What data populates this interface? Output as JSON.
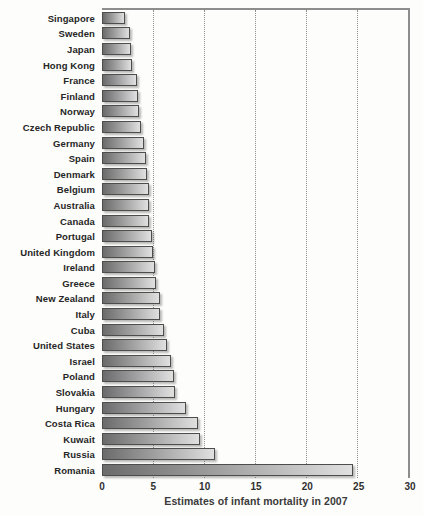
{
  "chart_data": {
    "type": "bar",
    "orientation": "horizontal",
    "title": "",
    "xlabel": "Estimates of infant mortality in 2007",
    "ylabel": "",
    "xlim": [
      0,
      30
    ],
    "x_ticks": [
      0,
      5,
      10,
      15,
      20,
      25,
      30
    ],
    "gridline_values": [
      5,
      10,
      15,
      20,
      25
    ],
    "grid": "vertical dotted gridlines; solid top and right plot border",
    "legend": "none",
    "categories": [
      "Singapore",
      "Sweden",
      "Japan",
      "Hong Kong",
      "France",
      "Finland",
      "Norway",
      "Czech Republic",
      "Germany",
      "Spain",
      "Denmark",
      "Belgium",
      "Australia",
      "Canada",
      "Portugal",
      "United Kingdom",
      "Ireland",
      "Greece",
      "New Zealand",
      "Italy",
      "Cuba",
      "United States",
      "Israel",
      "Poland",
      "Slovakia",
      "Hungary",
      "Costa Rica",
      "Kuwait",
      "Russia",
      "Romania"
    ],
    "values": [
      2.3,
      2.76,
      2.8,
      2.94,
      3.41,
      3.52,
      3.64,
      3.86,
      4.08,
      4.31,
      4.45,
      4.56,
      4.57,
      4.63,
      4.92,
      5.01,
      5.22,
      5.34,
      5.67,
      5.72,
      6.04,
      6.37,
      6.75,
      7.07,
      7.12,
      8.21,
      9.45,
      9.57,
      11.06,
      24.59
    ]
  },
  "colors": {
    "bar_gradient_left": "#6b6b6b",
    "bar_gradient_right": "#e0e0e0",
    "bar_border": "#4d4d4d",
    "plot_border": "#8d8d8d",
    "gridline": "#8f8f8f",
    "label_text": "#262626",
    "tick_text": "#303030",
    "title_text": "#3a3a3a",
    "background": "#fdfdfb"
  }
}
